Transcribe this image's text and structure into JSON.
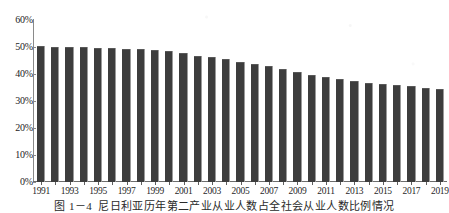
{
  "caption": {
    "number": "图 1－4",
    "text": "尼日利亚历年第二产业从业人数占全社会从业人数比例情况"
  },
  "chart_data": {
    "type": "bar",
    "title": "",
    "xlabel": "",
    "ylabel": "",
    "ylim": [
      0,
      60
    ],
    "ytick_labels": [
      "0%",
      "10%",
      "20%",
      "30%",
      "40%",
      "50%",
      "60%"
    ],
    "ytick_values": [
      0,
      10,
      20,
      30,
      40,
      50,
      60
    ],
    "grid": false,
    "legend": "none",
    "bar_color": "#3d3d3d",
    "categories": [
      "1991",
      "1992",
      "1993",
      "1994",
      "1995",
      "1996",
      "1997",
      "1998",
      "1999",
      "2000",
      "2001",
      "2002",
      "2003",
      "2004",
      "2005",
      "2006",
      "2007",
      "2008",
      "2009",
      "2010",
      "2011",
      "2012",
      "2013",
      "2014",
      "2015",
      "2016",
      "2017",
      "2018",
      "2019"
    ],
    "xtick_labels_shown": [
      "1991",
      "1993",
      "1995",
      "1997",
      "1999",
      "2001",
      "2003",
      "2005",
      "2007",
      "2009",
      "2011",
      "2013",
      "2015",
      "2017",
      "2019"
    ],
    "values": [
      50.3,
      50.1,
      50.1,
      50.0,
      49.8,
      49.6,
      49.4,
      49.2,
      48.9,
      48.5,
      47.8,
      46.8,
      46.2,
      45.4,
      44.6,
      43.7,
      42.8,
      41.8,
      40.7,
      39.8,
      38.8,
      38.0,
      37.3,
      36.8,
      36.3,
      35.8,
      35.4,
      35.0,
      34.6
    ],
    "units": "percent"
  }
}
